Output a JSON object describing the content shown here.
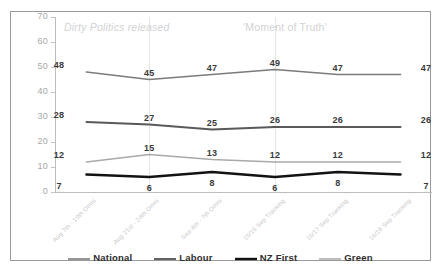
{
  "chart_data": {
    "type": "line",
    "title": "",
    "xlabel": "",
    "ylabel": "",
    "ylim": [
      0,
      70
    ],
    "yticks": [
      0,
      10,
      20,
      30,
      40,
      50,
      60,
      70
    ],
    "grid": false,
    "legend_position": "bottom",
    "categories": [
      "Aug 7th - 10th Omni",
      "Aug 21st - 24th Omni",
      "Sep 4th - 7th Omni",
      "15/16 Sep Tracking",
      "16/17 Sep Tracking",
      "16/18 Sep Tracking"
    ],
    "series": [
      {
        "name": "National",
        "values": [
          48,
          45,
          47,
          49,
          47,
          47
        ],
        "color": "#7b7b7b"
      },
      {
        "name": "Labour",
        "values": [
          28,
          27,
          25,
          26,
          26,
          26
        ],
        "color": "#5a5a5a"
      },
      {
        "name": "NZ First",
        "values": [
          7,
          6,
          8,
          6,
          8,
          7
        ],
        "color": "#121212"
      },
      {
        "name": "Green",
        "values": [
          12,
          15,
          13,
          12,
          12,
          12
        ],
        "color": "#a9a9a9"
      }
    ],
    "annotations": [
      {
        "text": "Dirty Politics released",
        "at_category_index": 1,
        "style": "italic"
      },
      {
        "text": "'Moment of Truth'",
        "at_category_index": 3,
        "style": "plain"
      }
    ]
  }
}
